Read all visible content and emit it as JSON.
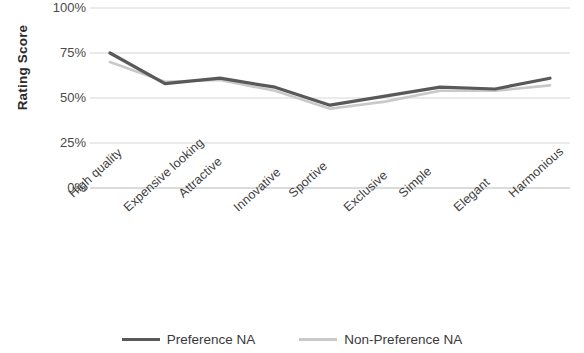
{
  "chart_data": {
    "type": "line",
    "title": "",
    "xlabel": "",
    "ylabel": "Rating Score",
    "ylim": [
      0,
      100
    ],
    "ytick_labels": [
      "100%",
      "75%",
      "50%",
      "25%",
      "0%"
    ],
    "ytick_values": [
      100,
      75,
      50,
      25,
      0
    ],
    "grid": true,
    "grid_axis": "y",
    "legend_position": "bottom",
    "categories": [
      "High quality",
      "Expensive looking",
      "Attractive",
      "Innovative",
      "Sportive",
      "Exclusive",
      "Simple",
      "Elegant",
      "Harmonious"
    ],
    "series": [
      {
        "name": "Preference NA",
        "color": "#595959",
        "values": [
          75,
          58,
          61,
          56,
          46,
          51,
          56,
          55,
          61
        ]
      },
      {
        "name": "Non-Preference NA",
        "color": "#c9c9c9",
        "values": [
          70,
          59,
          60,
          54,
          44,
          48,
          54,
          54,
          57
        ]
      }
    ]
  },
  "axes": {
    "y_title": "Rating Score"
  },
  "legend": {
    "items": [
      {
        "label": "Preference NA"
      },
      {
        "label": "Non-Preference NA"
      }
    ]
  }
}
